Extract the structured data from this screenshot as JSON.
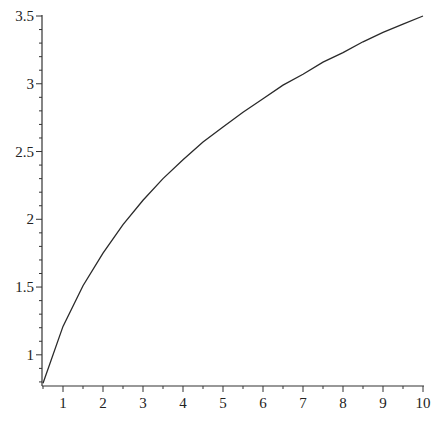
{
  "chart_data": {
    "type": "line",
    "title": "",
    "xlabel": "",
    "ylabel": "",
    "xlim": [
      0.5,
      10
    ],
    "ylim": [
      0.77,
      3.5
    ],
    "grid": false,
    "legend": "none",
    "x_ticks": [
      1,
      2,
      3,
      4,
      5,
      6,
      7,
      8,
      9,
      10
    ],
    "x_tick_labels": [
      "1",
      "2",
      "3",
      "4",
      "5",
      "6",
      "7",
      "8",
      "9",
      "10"
    ],
    "x_minor_step": 0.5,
    "y_ticks": [
      1,
      1.5,
      2,
      2.5,
      3,
      3.5
    ],
    "y_tick_labels": [
      "1",
      "1.5",
      "2",
      "2.5",
      "3",
      "3.5"
    ],
    "y_minor_step": 0.1,
    "series": [
      {
        "name": "curve",
        "color": "#2a2a2a",
        "x": [
          0.5,
          1,
          1.5,
          2,
          2.5,
          3,
          3.5,
          4,
          4.5,
          5,
          5.5,
          6,
          6.5,
          7,
          7.5,
          8,
          8.5,
          9,
          9.5,
          10
        ],
        "y": [
          0.79,
          1.21,
          1.51,
          1.75,
          1.96,
          2.14,
          2.3,
          2.44,
          2.57,
          2.68,
          2.79,
          2.89,
          2.99,
          3.07,
          3.16,
          3.23,
          3.31,
          3.38,
          3.44,
          3.5
        ]
      }
    ]
  }
}
